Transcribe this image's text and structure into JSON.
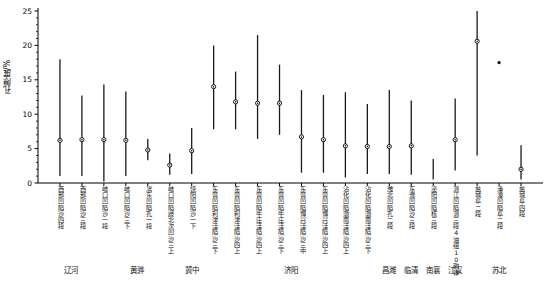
{
  "chart_data": {
    "type": "scatter",
    "title": "",
    "subtitle": "",
    "xlabel": "",
    "ylabel": "孔隙度/%",
    "ylim": [
      0,
      25
    ],
    "yticks": [
      0,
      5,
      10,
      15,
      20,
      25
    ],
    "grid": false,
    "legend": "none",
    "marker": "open-circle-with-dot",
    "series_note": "每条竖线为孔隙度区间, 中间点为平均值",
    "categories": [
      "西部凹陷沙四段",
      "西部凹陷沙三段",
      "岐口凹陷沙一段",
      "岐口凹陷沙三下",
      "滨东凹陷孔一段",
      "岐口凹陷歧北次凹沙三上",
      "饶阳凹陷沙一下",
      "东营凹陷利津洼陷沙三下",
      "东营凹陷利津洼陷沙四上",
      "东营凹陷牛庄洼陷沙四上",
      "东营凹陷牛庄洼陷沙三下",
      "东营凹陷博兴洼陷沙三中",
      "东营凹陷博兴洼陷沙四上",
      "沾化凹陷渤南洼陷沙四上",
      "沾化凹陷渤南洼陷沙三下",
      "潍北凹陷孔二段",
      "东濮凹陷沙三段",
      "泌阳凹陷核三段",
      "潜江凹陷潜三段4油组10韵律",
      "盐城阜二段",
      "溱潼凹陷阜二段",
      "盐城阜四段"
    ],
    "points": [
      {
        "category": "西部凹陷沙四段",
        "low": 1.0,
        "high": 18.0,
        "mean": 6.2
      },
      {
        "category": "西部凹陷沙三段",
        "low": 1.0,
        "high": 12.7,
        "mean": 6.3
      },
      {
        "category": "岐口凹陷沙一段",
        "low": 0.2,
        "high": 14.3,
        "mean": 6.3
      },
      {
        "category": "岐口凹陷沙三下",
        "low": 1.0,
        "high": 13.3,
        "mean": 6.2
      },
      {
        "category": "滨东凹陷孔一段",
        "low": 3.3,
        "high": 6.4,
        "mean": 4.8
      },
      {
        "category": "岐口凹陷歧北次凹沙三上",
        "low": 1.2,
        "high": 4.3,
        "mean": 2.6
      },
      {
        "category": "饶阳凹陷沙一下",
        "low": 1.3,
        "high": 8.0,
        "mean": 4.7
      },
      {
        "category": "东营凹陷利津洼陷沙三下",
        "low": 7.8,
        "high": 20.0,
        "mean": 14.0
      },
      {
        "category": "东营凹陷利津洼陷沙四上",
        "low": 7.8,
        "high": 16.2,
        "mean": 11.8
      },
      {
        "category": "东营凹陷牛庄洼陷沙四上",
        "low": 6.4,
        "high": 21.5,
        "mean": 11.6
      },
      {
        "category": "东营凹陷牛庄洼陷沙三下",
        "low": 7.0,
        "high": 17.2,
        "mean": 11.6
      },
      {
        "category": "东营凹陷博兴洼陷沙三中",
        "low": 1.5,
        "high": 13.5,
        "mean": 6.7
      },
      {
        "category": "东营凹陷博兴洼陷沙四上",
        "low": 1.5,
        "high": 12.8,
        "mean": 6.3
      },
      {
        "category": "沾化凹陷渤南洼陷沙四上",
        "low": 0.8,
        "high": 13.2,
        "mean": 5.4
      },
      {
        "category": "沾化凹陷渤南洼陷沙三下",
        "low": 1.3,
        "high": 11.5,
        "mean": 5.3
      },
      {
        "category": "潍北凹陷孔二段",
        "low": 1.3,
        "high": 13.5,
        "mean": 5.3
      },
      {
        "category": "东濮凹陷沙三段",
        "low": 1.2,
        "high": 12.0,
        "mean": 5.4
      },
      {
        "category": "泌阳凹陷核三段",
        "low": 0.5,
        "high": 3.5,
        "mean": null
      },
      {
        "category": "潜江凹陷潜三段4油组10韵律",
        "low": 1.8,
        "high": 12.3,
        "mean": 6.3
      },
      {
        "category": "盐城阜二段",
        "low": 4.0,
        "high": 25.0,
        "mean": 20.6
      },
      {
        "category": "溱潼凹陷阜二段",
        "low": 17.5,
        "high": 17.5,
        "mean": 17.5
      },
      {
        "category": "盐城阜四段",
        "low": 4.0,
        "high": 16.0,
        "mean": 9.0
      }
    ],
    "extra_point": {
      "category": "盐城阜二段",
      "value": 17.5,
      "note": "孤立散点, 无区间线"
    },
    "last_point": {
      "category": "盐城阜四段",
      "low": 0.5,
      "high": 5.5,
      "mean": 2.0
    },
    "groups": [
      {
        "label": "辽河",
        "start": 0,
        "end": 1
      },
      {
        "label": "黄骅",
        "start": 2,
        "end": 5
      },
      {
        "label": "冀中",
        "start": 6,
        "end": 6
      },
      {
        "label": "济阳",
        "start": 7,
        "end": 14
      },
      {
        "label": "昌潍",
        "start": 15,
        "end": 15
      },
      {
        "label": "临清",
        "start": 16,
        "end": 16
      },
      {
        "label": "南襄",
        "start": 17,
        "end": 17
      },
      {
        "label": "江汉",
        "start": 18,
        "end": 18
      },
      {
        "label": "苏北",
        "start": 19,
        "end": 21
      }
    ],
    "colors": {
      "axis": "#000000",
      "line": "#1a1a1a",
      "marker_fill": "#ffffff",
      "marker_edge": "#000000",
      "background": "#ffffff"
    }
  },
  "figure": {
    "caption": ""
  }
}
